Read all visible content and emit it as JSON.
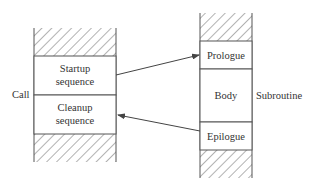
{
  "diagram": {
    "caller": {
      "side_label": "Call",
      "blocks": [
        {
          "line1": "Startup",
          "line2": "sequence"
        },
        {
          "line1": "Cleanup",
          "line2": "sequence"
        }
      ]
    },
    "callee": {
      "side_label": "Subroutine",
      "blocks": [
        {
          "label": "Prologue"
        },
        {
          "label": "Body"
        },
        {
          "label": "Epilogue"
        }
      ]
    },
    "arrows": [
      {
        "from": "Startup sequence",
        "to": "Prologue"
      },
      {
        "from": "Epilogue",
        "to": "Cleanup sequence"
      }
    ],
    "colors": {
      "line": "#555555",
      "text": "#333333",
      "hatch": "#666666",
      "background": "#ffffff"
    }
  }
}
